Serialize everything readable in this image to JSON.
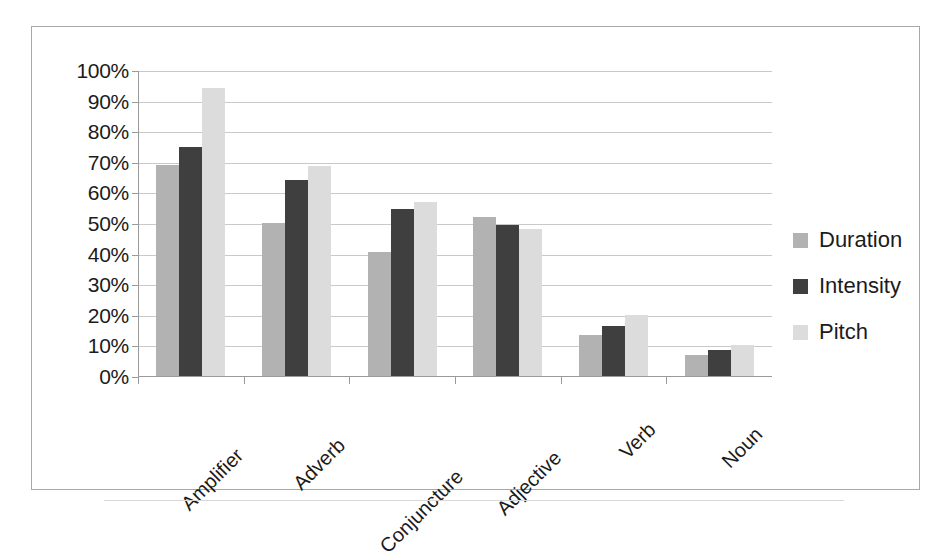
{
  "chart_data": {
    "type": "bar",
    "title": "",
    "xlabel": "",
    "ylabel": "",
    "ylim": [
      0,
      100
    ],
    "grid": true,
    "legend_position": "right",
    "value_suffix": "%",
    "categories": [
      "Amplifier",
      "Adverb",
      "Conjuncture",
      "Adjective",
      "Verb",
      "Noun"
    ],
    "ytick_labels": [
      "100%",
      "90%",
      "80%",
      "70%",
      "60%",
      "50%",
      "40%",
      "30%",
      "20%",
      "10%",
      "0%"
    ],
    "ytick_values": [
      100,
      90,
      80,
      70,
      60,
      50,
      40,
      30,
      20,
      10,
      0
    ],
    "series": [
      {
        "name": "Duration",
        "color": "#b2b2b2",
        "values": [
          69,
          50,
          40.5,
          52,
          13.5,
          7
        ]
      },
      {
        "name": "Intensity",
        "color": "#3f3f3f",
        "values": [
          75,
          64,
          54.5,
          49.5,
          16.5,
          8.5
        ]
      },
      {
        "name": "Pitch",
        "color": "#dcdcdc",
        "values": [
          94,
          68.5,
          57,
          48,
          20,
          10
        ]
      }
    ]
  },
  "legend": {
    "items": [
      {
        "label": "Duration",
        "swatch": "duration-swatch"
      },
      {
        "label": "Intensity",
        "swatch": "intensity-swatch"
      },
      {
        "label": "Pitch",
        "swatch": "pitch-swatch"
      }
    ]
  }
}
